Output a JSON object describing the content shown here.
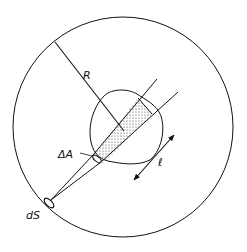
{
  "diagram": {
    "type": "geometry-radiation-beam",
    "labels": {
      "radius": "R",
      "area_element": "ΔA",
      "path_length": "ℓ",
      "surface_element": "dS"
    },
    "colors": {
      "stroke": "#111111",
      "background": "#ffffff",
      "stipple": "#333333"
    },
    "elements": [
      {
        "name": "outer-sphere",
        "shape": "circle"
      },
      {
        "name": "radius-line",
        "label": "R"
      },
      {
        "name": "irregular-body",
        "shape": "blob"
      },
      {
        "name": "beam-cone",
        "from": "dS"
      },
      {
        "name": "stippled-column",
        "inside": "irregular-body"
      },
      {
        "name": "length-arrow",
        "label": "ℓ",
        "double_headed": true
      }
    ]
  }
}
